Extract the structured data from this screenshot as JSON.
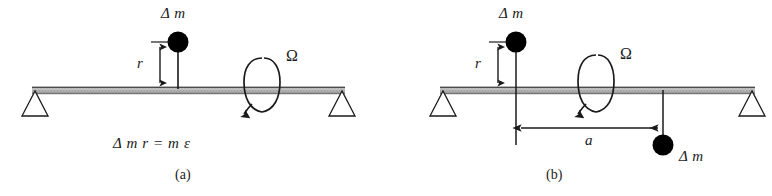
{
  "figure": {
    "background_color": "#ffffff",
    "ink_color": "#1a1a1a",
    "beam_fill_color": "#b9b9b9",
    "mass_color": "#000000"
  },
  "panels": [
    {
      "id": "a",
      "caption": "(a)",
      "labels": {
        "mass_top": "Δ m",
        "radius": "r",
        "speed": "Ω",
        "equation": "Δ m r = m ε"
      },
      "elements": {
        "beam": "shaft-beam",
        "left_support": "pin-support-left",
        "right_support": "pin-support-right",
        "mass_top": "unbalance-mass-top",
        "radius_dimension": "radius-dimension-r",
        "rotation_arrow": "rotation-arrow-omega"
      }
    },
    {
      "id": "b",
      "caption": "(b)",
      "labels": {
        "mass_top": "Δ m",
        "mass_bottom": "Δ m",
        "radius": "r",
        "distance": "a",
        "speed": "Ω"
      },
      "elements": {
        "beam": "shaft-beam",
        "left_support": "pin-support-left",
        "right_support": "pin-support-right",
        "mass_top": "unbalance-mass-top",
        "mass_bottom": "unbalance-mass-bottom",
        "radius_dimension": "radius-dimension-r",
        "distance_dimension": "distance-dimension-a",
        "rotation_arrow": "rotation-arrow-omega"
      }
    }
  ]
}
